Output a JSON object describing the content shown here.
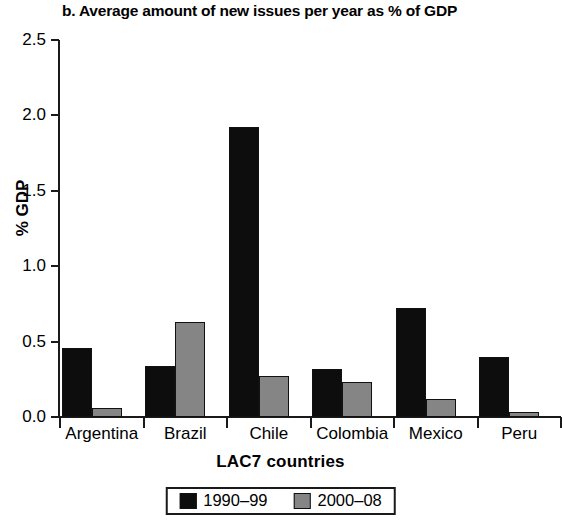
{
  "chart_data": {
    "type": "bar",
    "title": "b. Average amount of new issues per year as % of GDP",
    "xlabel": "LAC7 countries",
    "ylabel": "% GDP",
    "categories": [
      "Argentina",
      "Brazil",
      "Chile",
      "Colombia",
      "Mexico",
      "Peru"
    ],
    "series": [
      {
        "name": "1990–99",
        "color": "#0d0d0d",
        "values": [
          0.46,
          0.34,
          1.92,
          0.32,
          0.72,
          0.4
        ]
      },
      {
        "name": "2000–08",
        "color": "#858585",
        "values": [
          0.06,
          0.63,
          0.27,
          0.23,
          0.12,
          0.03
        ]
      }
    ],
    "ylim": [
      0.0,
      2.5
    ],
    "yticks": [
      "0.0",
      "0.5",
      "1.0",
      "1.5",
      "2.0",
      "2.5"
    ],
    "ytick_values": [
      0.0,
      0.5,
      1.0,
      1.5,
      2.0,
      2.5
    ],
    "grid": false,
    "legend_position": "bottom-center"
  }
}
